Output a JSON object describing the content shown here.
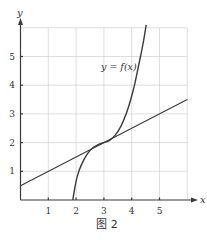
{
  "chart_data": {
    "type": "line",
    "title": "",
    "caption": "图 2",
    "xlabel": "x",
    "ylabel": "y",
    "xlim": [
      0,
      6
    ],
    "ylim": [
      0,
      6
    ],
    "grid": true,
    "x_ticks": [
      "1",
      "2",
      "3",
      "4",
      "5"
    ],
    "y_ticks": [
      "1",
      "2",
      "3",
      "4",
      "5"
    ],
    "annotations": [
      {
        "text": "y = f(x)",
        "x": 3.5,
        "y": 4.7
      }
    ],
    "series": [
      {
        "name": "y = f(x)",
        "type": "curve",
        "x": [
          1.88,
          1.95,
          2.05,
          2.2,
          2.4,
          2.6,
          2.8,
          3.0,
          3.2,
          3.4,
          3.6,
          3.8,
          3.95,
          4.1,
          4.25,
          4.4,
          4.52
        ],
        "y": [
          0.0,
          0.4,
          0.85,
          1.25,
          1.6,
          1.82,
          1.93,
          2.0,
          2.08,
          2.25,
          2.55,
          3.0,
          3.45,
          4.0,
          4.7,
          5.4,
          6.1
        ]
      },
      {
        "name": "tangent line y = 0.5x + 0.5",
        "type": "line",
        "x": [
          0,
          6
        ],
        "y": [
          0.5,
          3.5
        ]
      }
    ]
  }
}
